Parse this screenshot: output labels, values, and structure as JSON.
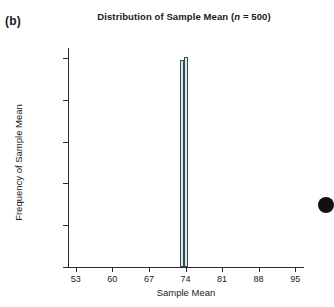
{
  "panel": {
    "label": "(b)"
  },
  "chart_data": {
    "type": "bar",
    "title_plain": "Distribution of Sample Mean (n = 500)",
    "title_prefix": "Distribution of Sample Mean (",
    "title_italic": "n",
    "title_suffix": " = 500)",
    "xlabel": "Sample Mean",
    "ylabel": "Frequency of Sample Mean",
    "xlim": [
      51.5,
      96.5
    ],
    "ylim": [
      0,
      2620
    ],
    "xticks": [
      53,
      60,
      67,
      74,
      81,
      88,
      95
    ],
    "xtick_labels": [
      "53",
      "60",
      "67",
      "74",
      "81",
      "88",
      "95"
    ],
    "yticks": [
      0,
      500,
      1000,
      1500,
      2000,
      2500
    ],
    "ytick_labels": [
      "0",
      "500",
      "1000",
      "1500",
      "2000",
      "2500"
    ],
    "grid": false,
    "legend": null,
    "bar_fill": "#d5ecef",
    "bar_edge": "#3b4a4c",
    "categories": [
      73.35,
      74.1
    ],
    "values": [
      2480,
      2515
    ],
    "bar_width": 0.72,
    "annotations": []
  },
  "marks": {
    "edge_dot_color": "#111111"
  }
}
